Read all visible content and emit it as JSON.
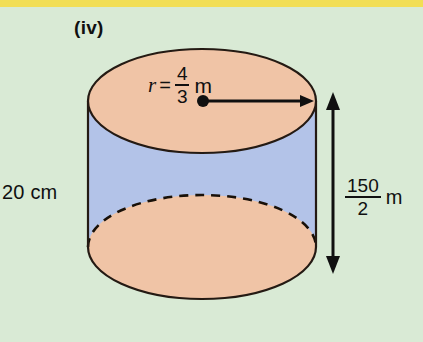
{
  "page": {
    "background_color": "#d9ead5",
    "top_band_color": "#f2de55"
  },
  "figure": {
    "type": "cylinder-diagram",
    "part_label": "(iv)",
    "left_measure": "20 cm",
    "radius": {
      "variable": "r",
      "equals": "=",
      "numerator": "4",
      "denominator": "3",
      "unit": "m"
    },
    "height": {
      "numerator": "150",
      "denominator": "2",
      "unit": "m"
    },
    "colors": {
      "top_face": "#f0c4a6",
      "bottom_face": "#f0c4a6",
      "body": "#b3c3e8",
      "outline": "#241a13"
    }
  }
}
